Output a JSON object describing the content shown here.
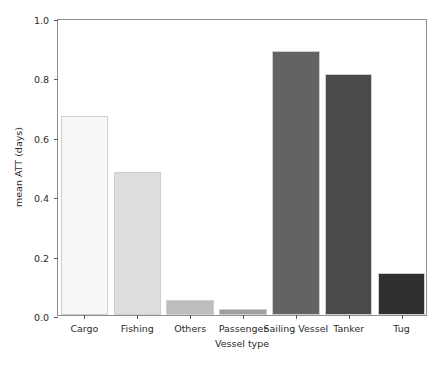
{
  "chart_data": {
    "type": "bar",
    "title": "",
    "xlabel": "Vessel type",
    "ylabel": "mean ATT (days)",
    "categories": [
      "Cargo",
      "Fishing",
      "Others",
      "Passenger",
      "Sailing Vessel",
      "Tanker",
      "Tug"
    ],
    "values": [
      0.67,
      0.48,
      0.05,
      0.02,
      0.89,
      0.81,
      0.14
    ],
    "ylim": [
      0.0,
      1.0
    ],
    "yticks": [
      "0.0",
      "0.2",
      "0.4",
      "0.6",
      "0.8",
      "1.0"
    ],
    "ytick_values": [
      0.0,
      0.2,
      0.4,
      0.6,
      0.8,
      1.0
    ],
    "grid": false,
    "legend": "none",
    "bar_colors": [
      "#f7f7f7",
      "#dedede",
      "#bdbdbd",
      "#9e9e9e",
      "#636363",
      "#4a4a4a",
      "#303030"
    ],
    "bar_edge_color": "#cfcfcf",
    "axis_color": "#8f8f8f"
  }
}
